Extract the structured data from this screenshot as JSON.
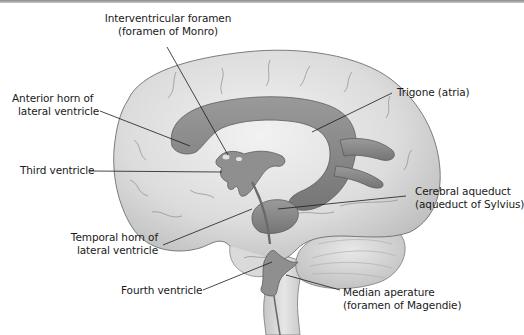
{
  "diagram": {
    "colors": {
      "brain_fill": "#d9d9d9",
      "brain_highlight": "#ececec",
      "brain_outline": "#6e6e6e",
      "ventricle_fill": "#8a8a8a",
      "ventricle_dark": "#6a6a6a",
      "leader_line": "#1a1a1a",
      "label_text": "#1a1a1a"
    },
    "labels": [
      {
        "id": "interventricular-foramen",
        "line1": "Interventricular foramen",
        "line2": "(foramen of Monro)"
      },
      {
        "id": "anterior-horn",
        "line1": "Anterior horn of",
        "line2": "lateral ventricle"
      },
      {
        "id": "trigone",
        "line1": "Trigone (atria)"
      },
      {
        "id": "third-ventricle",
        "line1": "Third ventricle"
      },
      {
        "id": "cerebral-aqueduct",
        "line1": "Cerebral aqueduct",
        "line2": "(aqueduct of Sylvius)"
      },
      {
        "id": "temporal-horn",
        "line1": "Temporal horn of",
        "line2": "lateral ventricle"
      },
      {
        "id": "fourth-ventricle",
        "line1": "Fourth ventricle"
      },
      {
        "id": "median-aperture",
        "line1": "Median aperature",
        "line2": "(foramen of Magendie)"
      }
    ]
  }
}
